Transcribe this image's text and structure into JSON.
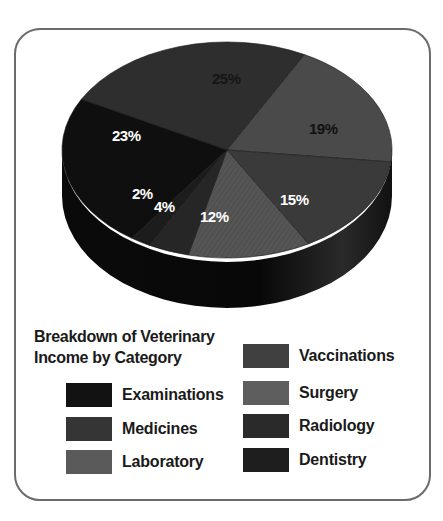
{
  "chart_data": {
    "type": "pie",
    "title": "Breakdown of Veterinary Income by Category",
    "style": "3d-pie",
    "legend_position": "bottom",
    "categories": [
      "Examinations",
      "Medicines",
      "Laboratory",
      "Vaccinations",
      "Surgery",
      "Radiology",
      "Dentistry"
    ],
    "values": [
      23,
      25,
      2,
      19,
      12,
      15,
      4
    ],
    "unit": "%",
    "slices": [
      {
        "label": "Medicines",
        "value": 25,
        "color": "#2e2e2e",
        "text_color": "#111111"
      },
      {
        "label": "Vaccinations",
        "value": 19,
        "color": "#4a4a4a",
        "text_color": "#111111"
      },
      {
        "label": "Radiology",
        "value": 15,
        "color": "#3a3a3a",
        "text_color": "#ffffff"
      },
      {
        "label": "Surgery",
        "value": 12,
        "color": "#555555",
        "text_color": "#ffffff"
      },
      {
        "label": "Dentistry",
        "value": 4,
        "color": "#262626",
        "text_color": "#ffffff"
      },
      {
        "label": "Laboratory",
        "value": 2,
        "color": "#1c1c1c",
        "text_color": "#ffffff"
      },
      {
        "label": "Examinations",
        "value": 23,
        "color": "#0f0f0f",
        "text_color": "#ffffff"
      }
    ]
  },
  "labels": {
    "p25": "25%",
    "p19": "19%",
    "p15": "15%",
    "p12": "12%",
    "p4": "4%",
    "p2": "2%",
    "p23": "23%"
  },
  "legend": {
    "title_line1": "Breakdown of Veterinary",
    "title_line2": "Income by Category",
    "items": [
      {
        "label": "Examinations",
        "color": "#121212"
      },
      {
        "label": "Medicines",
        "color": "#353535"
      },
      {
        "label": "Laboratory",
        "color": "#5a5a5a"
      },
      {
        "label": "Vaccinations",
        "color": "#404040"
      },
      {
        "label": "Surgery",
        "color": "#5e5e5e"
      },
      {
        "label": "Radiology",
        "color": "#2a2a2a"
      },
      {
        "label": "Dentistry",
        "color": "#1e1e1e"
      }
    ]
  }
}
